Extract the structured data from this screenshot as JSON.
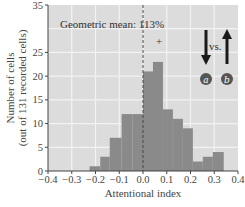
{
  "chart_data": {
    "type": "bar",
    "title": "",
    "xlabel": "Attentional index",
    "ylabel": "Number of cells",
    "ylabel_sub": "(out of 131 recorded cells)",
    "xlim": [
      -0.4,
      0.4
    ],
    "ylim": [
      0,
      35
    ],
    "xticks": [
      "-0.4",
      "-0.3",
      "-0.2",
      "-0.1",
      "0.0",
      "0.1",
      "0.2",
      "0.3",
      "0.4"
    ],
    "yticks": [
      "0",
      "5",
      "10",
      "15",
      "20",
      "25",
      "35"
    ],
    "grid": true,
    "bins": [
      {
        "x0": -0.225,
        "x1": -0.18,
        "value": 1
      },
      {
        "x0": -0.18,
        "x1": -0.14,
        "value": 3
      },
      {
        "x0": -0.14,
        "x1": -0.09,
        "value": 7
      },
      {
        "x0": -0.09,
        "x1": -0.045,
        "value": 12
      },
      {
        "x0": -0.045,
        "x1": 0.0,
        "value": 12
      },
      {
        "x0": 0.0,
        "x1": 0.042,
        "value": 21
      },
      {
        "x0": 0.042,
        "x1": 0.084,
        "value": 23
      },
      {
        "x0": 0.084,
        "x1": 0.126,
        "value": 13
      },
      {
        "x0": 0.126,
        "x1": 0.168,
        "value": 11
      },
      {
        "x0": 0.168,
        "x1": 0.21,
        "value": 9
      },
      {
        "x0": 0.21,
        "x1": 0.252,
        "value": 2
      },
      {
        "x0": 0.252,
        "x1": 0.294,
        "value": 3
      },
      {
        "x0": 0.294,
        "x1": 0.34,
        "value": 4
      }
    ],
    "annotations": {
      "mean_label": "Geometric mean: 113%",
      "mean_line_x": 0.0,
      "peak_marker": "+",
      "vs_label": "vs.",
      "arrow_a_label": "a",
      "arrow_b_label": "b"
    },
    "colors": {
      "plot_bg": "#dcdcdc",
      "bar": "#8a8a8a",
      "grid": "#f2f2f2",
      "arrow": "#1a1a1a",
      "badge": "#555555"
    }
  }
}
